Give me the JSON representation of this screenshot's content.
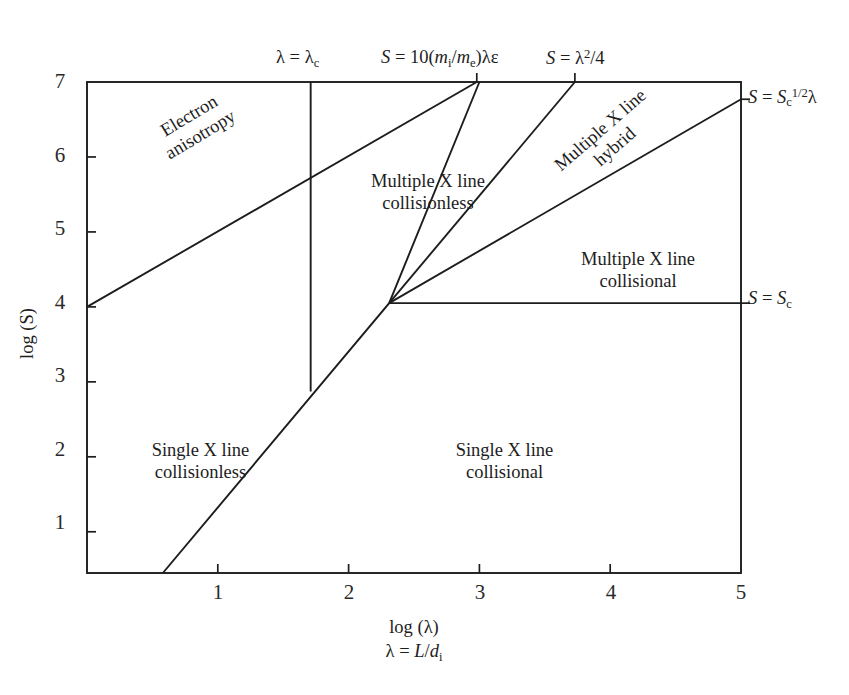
{
  "figure": {
    "kind": "phase-diagram",
    "background": "#ffffff",
    "line_color": "#1d1d1d",
    "text_color": "#1d1d1d"
  },
  "axes": {
    "x": {
      "title_line1": "log (λ)",
      "title_line2_html": "λ = <i class=\"v\">L</i>/<i class=\"v\">d</i><sub>i</sub>",
      "ticks": [
        "1",
        "2",
        "3",
        "4",
        "5"
      ],
      "tick_values": [
        1,
        2,
        3,
        4,
        5
      ],
      "min": 0,
      "max": 5
    },
    "y": {
      "title": "log (S)",
      "ticks": [
        "7",
        "6",
        "5",
        "4",
        "3",
        "2",
        "1"
      ],
      "tick_values": [
        7,
        6,
        5,
        4,
        3,
        2,
        1
      ],
      "min": 0.45,
      "max": 7
    }
  },
  "boundary_labels": {
    "lambda_c_html": "λ = λ<sub>c</sub>",
    "s_ion_electron_html": "<i class=\"v\">S</i> = 10(<i class=\"v\">m</i><sub>i</sub>/<i class=\"v\">m</i><sub>e</sub>)λε",
    "s_lambda_sq_html": "<i class=\"v\">S</i> = λ<sup>2</sup>/4",
    "s_sqrt_sc_html": "<i class=\"v\">S</i> = <i class=\"v\">S</i><sub>c</sub><sup>1/2</sup>λ",
    "s_sc_html": "<i class=\"v\">S</i> = <i class=\"v\">S</i><sub>c</sub>"
  },
  "regions": [
    {
      "id": "electron-anisotropy",
      "line1": "Electron",
      "line2": "anisotropy",
      "rotation": -31
    },
    {
      "id": "multiple-x-collisionless",
      "line1": "Multiple X line",
      "line2": "collisionless",
      "rotation": 0
    },
    {
      "id": "multiple-x-hybrid",
      "line1": "Multiple X line",
      "line2": "hybrid",
      "rotation": -41
    },
    {
      "id": "multiple-x-collisional",
      "line1": "Multiple X line",
      "line2": "collisional",
      "rotation": 0
    },
    {
      "id": "single-x-collisionless",
      "line1": "Single X line",
      "line2": "collisionless",
      "rotation": 0
    },
    {
      "id": "single-x-collisional",
      "line1": "Single X line",
      "line2": "collisional",
      "rotation": 0
    }
  ],
  "chart_data": {
    "type": "line",
    "title": "",
    "xlabel": "log (λ),  λ = L/d_i",
    "ylabel": "log (S)",
    "xlim": [
      0,
      5
    ],
    "ylim": [
      0.45,
      7
    ],
    "grid": false,
    "legend": "none",
    "frame": {
      "left_px": 87,
      "right_px": 741,
      "top_px": 82,
      "bottom_px": 573
    },
    "boundaries": [
      {
        "name": "electron anisotropy boundary",
        "label": "",
        "points": [
          [
            0,
            4.0
          ],
          [
            2.98,
            7.0
          ]
        ]
      },
      {
        "name": "lambda = lambda_c",
        "label": "λ = λ_c",
        "points": [
          [
            1.71,
            7.0
          ],
          [
            1.71,
            2.87
          ]
        ]
      },
      {
        "name": "S = 10(m_i/m_e) lambda epsilon",
        "label": "S = 10(m_i/m_e)λε",
        "points": [
          [
            0.58,
            0.45
          ],
          [
            2.31,
            4.05
          ],
          [
            3.0,
            7.0
          ]
        ]
      },
      {
        "name": "S = lambda^2 / 4",
        "label": "S = λ^2/4",
        "points": [
          [
            2.31,
            4.05
          ],
          [
            3.73,
            7.0
          ]
        ]
      },
      {
        "name": "S = S_c^{1/2} lambda",
        "label": "S = S_c^{1/2}λ",
        "points": [
          [
            2.31,
            4.05
          ],
          [
            5.0,
            6.77
          ]
        ]
      },
      {
        "name": "S = S_c",
        "label": "S = S_c",
        "points": [
          [
            2.31,
            4.05
          ],
          [
            5.0,
            4.05
          ]
        ]
      }
    ],
    "regions": [
      {
        "name": "Electron anisotropy",
        "centroid": [
          0.95,
          6.1
        ]
      },
      {
        "name": "Multiple X line collisionless",
        "centroid": [
          2.1,
          5.4
        ]
      },
      {
        "name": "Multiple X line hybrid",
        "centroid": [
          3.5,
          6.0
        ]
      },
      {
        "name": "Multiple X line collisional",
        "centroid": [
          3.9,
          4.9
        ]
      },
      {
        "name": "Single X line collisionless",
        "centroid": [
          0.85,
          2.1
        ]
      },
      {
        "name": "Single X line collisional",
        "centroid": [
          3.0,
          2.1
        ]
      }
    ]
  }
}
